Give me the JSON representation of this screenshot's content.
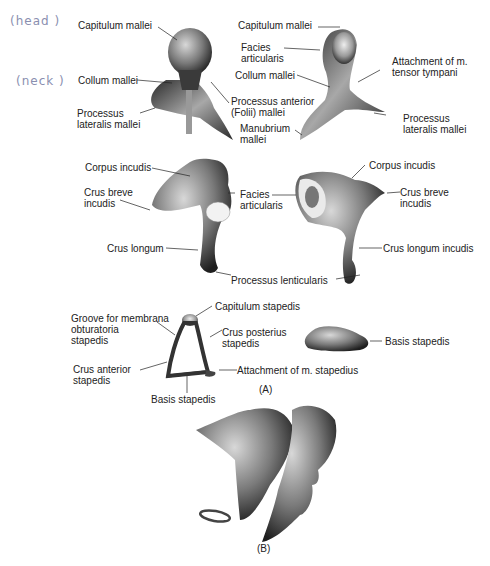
{
  "figure": {
    "panel_a_label": "(A)",
    "panel_b_label": "(B)",
    "handwritten_annotations": [
      "(head )",
      "(neck )"
    ]
  },
  "malleus_left": {
    "labels": {
      "capitulum": "Capitulum mallei",
      "collum": "Collum mallei",
      "processus_lateralis": "Processus\nlateralis mallei",
      "processus_anterior": "Processus anterior\n(Folii) mallei"
    }
  },
  "malleus_right": {
    "labels": {
      "capitulum": "Capitulum mallei",
      "facies": "Facies\narticularis",
      "attachment": "Attachment of m.\ntensor tympani",
      "collum": "Collum mallei",
      "manubrium": "Manubrium\nmallei",
      "processus_lateralis": "Processus\nlateralis mallei"
    }
  },
  "incus_left": {
    "labels": {
      "corpus": "Corpus incudis",
      "crus_breve": "Crus breve\nincudis",
      "crus_longum": "Crus longum"
    }
  },
  "incus_shared": {
    "facies": "Facies\narticularis",
    "processus_lenticularis": "Processus lenticularis"
  },
  "incus_right": {
    "labels": {
      "corpus": "Corpus incudis",
      "crus_breve": "Crus breve\nincudis",
      "crus_longum": "Crus longum incudis"
    }
  },
  "stapes": {
    "labels": {
      "groove": "Groove for membrana\nobturatoria\nstapedis",
      "capitulum": "Capitulum stapedis",
      "crus_posterius": "Crus posterius\nstapedis",
      "crus_anterior": "Crus anterior\nstapedis",
      "attachment": "Attachment of m. stapedius",
      "basis": "Basis stapedis",
      "basis_footplate": "Basis stapedis"
    }
  }
}
